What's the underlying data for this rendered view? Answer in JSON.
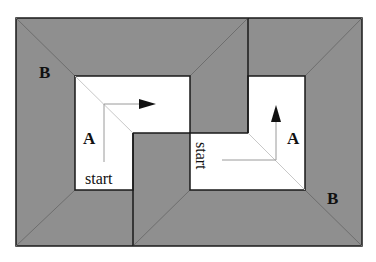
{
  "figure": {
    "colors": {
      "region_b_fill": "#8f8f8f",
      "room_fill": "#ffffff",
      "border": "#1a1a1a",
      "diagonal": "#6e6e6e",
      "inner_diagonal": "#c8c8c8",
      "arrow": "#111111",
      "path_line": "#9a9a9a"
    },
    "labels": {
      "region_b_top_left": "B",
      "region_b_bottom_right": "B",
      "room_left_label": "A",
      "room_right_label": "A",
      "start_left": "start",
      "start_right": "start"
    }
  }
}
